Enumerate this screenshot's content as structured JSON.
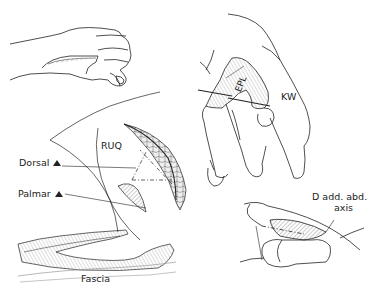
{
  "figure": {
    "panels": [
      {
        "id": "hand-lateral",
        "description": "Lateral view of hand with tendon strip along thumb"
      },
      {
        "id": "hand-dissection",
        "description": "Hand with EPL tendon retracted over rod"
      },
      {
        "id": "ruq-crosssection",
        "description": "Cross-section of curved tendon graft with dorsal and palmar orientation"
      },
      {
        "id": "fascia-strip",
        "description": "Longitudinal strip of tissue lifted from fascia"
      },
      {
        "id": "thumb-axis",
        "description": "Thumb joint showing adduction/abduction axis"
      }
    ],
    "labels": {
      "epl": "EPL",
      "kw": "KW",
      "ruq": "RUQ",
      "dorsal": "Dorsal",
      "palmar": "Palmar",
      "fascia": "Fascia",
      "axis_line1": "D add. abd.",
      "axis_line2": "axis"
    },
    "colors": {
      "ink": "#222222",
      "background": "#ffffff"
    }
  }
}
